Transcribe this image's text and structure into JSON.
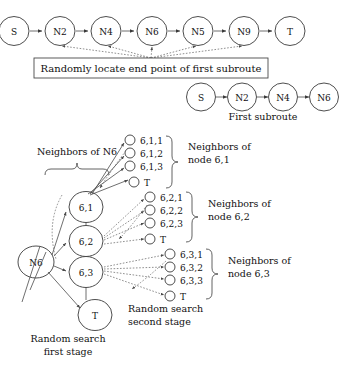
{
  "figure": {
    "top_chain": {
      "name": "full-route-chain",
      "nodes": [
        "S",
        "N2",
        "N4",
        "N6",
        "N5",
        "N9",
        "T"
      ]
    },
    "action_box": {
      "label": "Randomly locate end point of first subroute"
    },
    "subroute_chain": {
      "nodes": [
        "S",
        "N2",
        "N4",
        "N6"
      ],
      "caption": "First subroute"
    },
    "neighbors_of_n6_label": "Neighbors of N6",
    "root_node": "N6",
    "stage1": {
      "caption_line1": "Random search",
      "caption_line2": "first stage",
      "nodes": [
        "6,1",
        "6,2",
        "6,3",
        "T"
      ]
    },
    "stage2": {
      "caption_line1": "Random search",
      "caption_line2": "second stage"
    },
    "groups": [
      {
        "id": "group-6-1",
        "items": [
          "6,1,1",
          "6,1,2",
          "6,1,3",
          "T"
        ],
        "label_line1": "Neighbors of",
        "label_line2": "node 6,1"
      },
      {
        "id": "group-6-2",
        "items": [
          "6,2,1",
          "6,2,2",
          "6,2,3",
          "T"
        ],
        "label_line1": "Neighbors of",
        "label_line2": "node 6,2"
      },
      {
        "id": "group-6-3",
        "items": [
          "6,3,1",
          "6,3,2",
          "6,3,3",
          "T"
        ],
        "label_line1": "Neighbors of",
        "label_line2": "node 6,3"
      }
    ],
    "colors": {
      "stroke": "#3a3a3a",
      "background": "#ffffff",
      "text": "#111111"
    }
  }
}
